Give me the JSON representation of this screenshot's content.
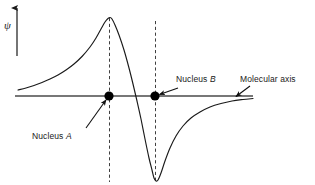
{
  "figure": {
    "title": "",
    "axis_label_y": "ψ",
    "labels": {
      "nucleus_a_prefix": "Nucleus ",
      "nucleus_a_symbol": "A",
      "nucleus_b_prefix": "Nucleus ",
      "nucleus_b_symbol": "B",
      "molecular_axis": "Molecular axis"
    },
    "colors": {
      "curve": "#1a1a1a",
      "axis": "#3a3a3a",
      "dashed": "#2a2a2a",
      "nucleus_dot": "#000000",
      "text": "#1a1a1a",
      "background": "#ffffff"
    }
  },
  "chart_data": {
    "type": "line",
    "title": "",
    "subtitle": "",
    "xlabel": "Molecular axis",
    "ylabel": "ψ",
    "grid": false,
    "legend": null,
    "axis": {
      "y_arrow": true,
      "y_arrow_x": 17,
      "y_arrow_top": 5,
      "y_arrow_bottom": 56,
      "x_line_y": 96,
      "x_line_start": 15,
      "x_line_end": 253,
      "zero_line": true
    },
    "xlim": [
      15,
      255
    ],
    "ylim": [
      185,
      5
    ],
    "nuclei": [
      {
        "name": "A",
        "x": 109,
        "y": 96,
        "r": 4.6
      },
      {
        "name": "B",
        "x": 155,
        "y": 96,
        "r": 4.6
      }
    ],
    "node_crossing_x": 133,
    "dashed_verticals": [
      {
        "name": "nucleus-a-guide",
        "x": 109.5,
        "y_top": 18,
        "y_bottom": 182
      },
      {
        "name": "nucleus-b-guide",
        "x": 155.5,
        "y_top": 21,
        "y_bottom": 183
      }
    ],
    "series": [
      {
        "name": "psi",
        "description": "Antibonding molecular orbital wavefunction: positive cusp at nucleus A, node between nuclei, negative cusp at nucleus B, decaying tails outward.",
        "points": [
          [
            18,
            90
          ],
          [
            26,
            88
          ],
          [
            34,
            85.5
          ],
          [
            42,
            82.5
          ],
          [
            50,
            79
          ],
          [
            58,
            75
          ],
          [
            66,
            70
          ],
          [
            74,
            64
          ],
          [
            82,
            56.5
          ],
          [
            90,
            47
          ],
          [
            96,
            38
          ],
          [
            101,
            29
          ],
          [
            105,
            22
          ],
          [
            108,
            18.5
          ],
          [
            110,
            17.5
          ],
          [
            112,
            19
          ],
          [
            115,
            25
          ],
          [
            119,
            35
          ],
          [
            124,
            50
          ],
          [
            129,
            68
          ],
          [
            133,
            84
          ],
          [
            137,
            101
          ],
          [
            141,
            119
          ],
          [
            145,
            139
          ],
          [
            149,
            158
          ],
          [
            152,
            170
          ],
          [
            154,
            178
          ],
          [
            156,
            181
          ],
          [
            158,
            180
          ],
          [
            161,
            173
          ],
          [
            165,
            161
          ],
          [
            170,
            148
          ],
          [
            176,
            136
          ],
          [
            183,
            126
          ],
          [
            191,
            118
          ],
          [
            200,
            112
          ],
          [
            210,
            107
          ],
          [
            221,
            103.5
          ],
          [
            232,
            101
          ],
          [
            243,
            99.5
          ],
          [
            253,
            98.5
          ]
        ]
      }
    ],
    "annotations": [
      {
        "name": "nucleus-a",
        "text": "Nucleus A",
        "text_x": 32,
        "text_y": 137,
        "arrow_from": [
          86,
          128
        ],
        "arrow_to": [
          106,
          100
        ]
      },
      {
        "name": "nucleus-b",
        "text": "Nucleus B",
        "text_x": 176,
        "text_y": 80,
        "arrow_from": [
          178,
          88
        ],
        "arrow_to": [
          159,
          95
        ]
      },
      {
        "name": "molecular-axis",
        "text": "Molecular axis",
        "text_x": 240,
        "text_y": 80,
        "arrow_from": [
          250,
          86
        ],
        "arrow_to": [
          236,
          97
        ]
      }
    ]
  }
}
